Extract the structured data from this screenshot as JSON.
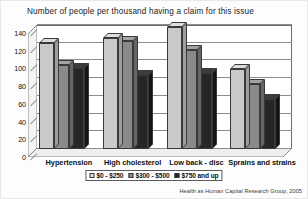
{
  "chart_data": {
    "type": "bar",
    "title": "Number of people per thousand having a claim for this issue",
    "xlabel": "",
    "ylabel": "",
    "ylim": [
      0,
      140
    ],
    "yticks": [
      0,
      20,
      40,
      60,
      80,
      100,
      120,
      140
    ],
    "grid": true,
    "legend_position": "bottom",
    "categories": [
      "Hypertension",
      "High cholesterol",
      "Low back - disc",
      "Sprains and strains"
    ],
    "series": [
      {
        "name": "$0 - $250",
        "color": "#c9c9c9",
        "values": [
          120,
          125,
          138,
          90
        ]
      },
      {
        "name": "$300 - $500",
        "color": "#8a8a8a",
        "values": [
          95,
          122,
          112,
          73
        ]
      },
      {
        "name": "$750 and up",
        "color": "#262626",
        "values": [
          92,
          84,
          86,
          56
        ]
      }
    ],
    "source": "Health as Human Capital Research Group, 2005"
  }
}
